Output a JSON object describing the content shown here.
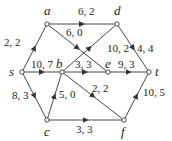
{
  "graph": {
    "nodes": [
      {
        "id": "a",
        "label": "a",
        "x": 47,
        "y": 24,
        "lx": 44,
        "ly": 15
      },
      {
        "id": "d",
        "label": "d",
        "x": 117,
        "y": 24,
        "lx": 114,
        "ly": 15
      },
      {
        "id": "s",
        "label": "s",
        "x": 22,
        "y": 72,
        "lx": 9,
        "ly": 76
      },
      {
        "id": "b",
        "label": "b",
        "x": 62,
        "y": 72,
        "lx": 56,
        "ly": 68
      },
      {
        "id": "e",
        "label": "e",
        "x": 108,
        "y": 72,
        "lx": 105,
        "ly": 68
      },
      {
        "id": "t",
        "label": "t",
        "x": 149,
        "y": 72,
        "lx": 155,
        "ly": 76
      },
      {
        "id": "c",
        "label": "c",
        "x": 47,
        "y": 120,
        "lx": 44,
        "ly": 136
      },
      {
        "id": "f",
        "label": "f",
        "x": 124,
        "y": 120,
        "lx": 121,
        "ly": 136
      }
    ],
    "edges": [
      {
        "from": "s",
        "to": "a",
        "label": "2, 2",
        "lx": 4,
        "ly": 46
      },
      {
        "from": "a",
        "to": "d",
        "label": "6, 2",
        "lx": 78,
        "ly": 15
      },
      {
        "from": "a",
        "to": "e",
        "label": "6, 0",
        "lx": 66,
        "ly": 36
      },
      {
        "from": "b",
        "to": "d",
        "label": "10, 2",
        "lx": 107,
        "ly": 52
      },
      {
        "from": "d",
        "to": "t",
        "label": "4, 4",
        "lx": 137,
        "ly": 52
      },
      {
        "from": "s",
        "to": "b",
        "label": "10, 7",
        "lx": 31,
        "ly": 68
      },
      {
        "from": "b",
        "to": "e",
        "label": "3, 3",
        "lx": 75,
        "ly": 68
      },
      {
        "from": "e",
        "to": "t",
        "label": "9, 3",
        "lx": 118,
        "ly": 68
      },
      {
        "from": "s",
        "to": "c",
        "label": "8, 3",
        "lx": 12,
        "ly": 99
      },
      {
        "from": "c",
        "to": "b",
        "label": "5, 0",
        "lx": 59,
        "ly": 98
      },
      {
        "from": "b",
        "to": "f",
        "label": "2, 2",
        "lx": 92,
        "ly": 92
      },
      {
        "from": "c",
        "to": "f",
        "label": "3, 3",
        "lx": 76,
        "ly": 133
      },
      {
        "from": "f",
        "to": "t",
        "label": "10, 5",
        "lx": 143,
        "ly": 96
      }
    ]
  }
}
